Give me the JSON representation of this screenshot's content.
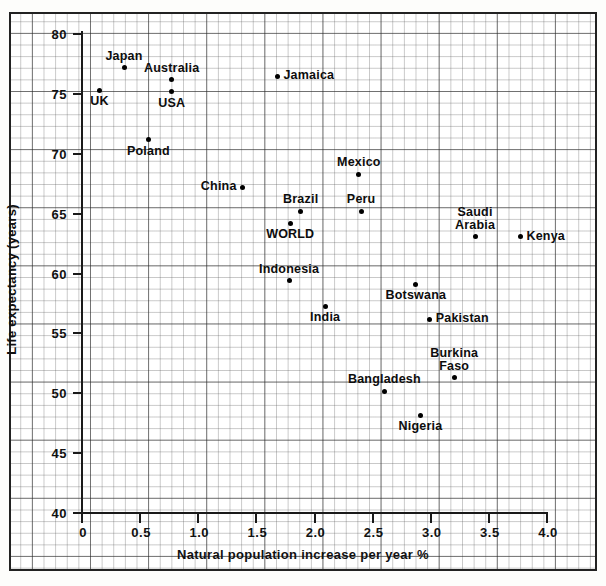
{
  "chart_data": {
    "type": "scatter",
    "title": "",
    "xlabel": "Natural population increase per year %",
    "ylabel": "Life expectancy (years)",
    "xlim": [
      0,
      4.0
    ],
    "ylim": [
      40,
      80
    ],
    "xticks": [
      "0",
      "0.5",
      "1.0",
      "1.5",
      "2.0",
      "2.5",
      "3.0",
      "3.5",
      "4.0"
    ],
    "xtick_values": [
      0,
      0.5,
      1.0,
      1.5,
      2.0,
      2.5,
      3.0,
      3.5,
      4.0
    ],
    "yticks": [
      "40",
      "45",
      "50",
      "55",
      "60",
      "65",
      "70",
      "75",
      "80"
    ],
    "ytick_values": [
      40,
      45,
      50,
      55,
      60,
      65,
      70,
      75,
      80
    ],
    "grid": "graph-paper",
    "legend": "none",
    "points": [
      {
        "name": "Japan",
        "x": 0.37,
        "y": 77.1,
        "label_pos": "above"
      },
      {
        "name": "UK",
        "x": 0.16,
        "y": 75.2,
        "label_pos": "below"
      },
      {
        "name": "Australia",
        "x": 0.78,
        "y": 76.1,
        "label_pos": "above"
      },
      {
        "name": "USA",
        "x": 0.78,
        "y": 75.1,
        "label_pos": "below"
      },
      {
        "name": "Jamaica",
        "x": 1.69,
        "y": 76.4,
        "label_pos": "right"
      },
      {
        "name": "Poland",
        "x": 0.58,
        "y": 71.1,
        "label_pos": "below"
      },
      {
        "name": "Mexico",
        "x": 2.39,
        "y": 68.2,
        "label_pos": "above"
      },
      {
        "name": "China",
        "x": 1.39,
        "y": 67.1,
        "label_pos": "left"
      },
      {
        "name": "Brazil",
        "x": 1.89,
        "y": 65.1,
        "label_pos": "above"
      },
      {
        "name": "Peru",
        "x": 2.41,
        "y": 65.1,
        "label_pos": "above"
      },
      {
        "name": "Saudi Arabia",
        "x": 3.39,
        "y": 63.0,
        "label_pos": "above"
      },
      {
        "name": "Kenya",
        "x": 3.78,
        "y": 63.0,
        "label_pos": "right"
      },
      {
        "name": "WORLD",
        "x": 1.8,
        "y": 64.1,
        "label_pos": "below"
      },
      {
        "name": "Indonesia",
        "x": 1.79,
        "y": 59.3,
        "label_pos": "above"
      },
      {
        "name": "Botswana",
        "x": 2.88,
        "y": 59.0,
        "label_pos": "below"
      },
      {
        "name": "India",
        "x": 2.1,
        "y": 57.2,
        "label_pos": "below"
      },
      {
        "name": "Pakistan",
        "x": 3.0,
        "y": 56.1,
        "label_pos": "right"
      },
      {
        "name": "Burkina Faso",
        "x": 3.21,
        "y": 51.2,
        "label_pos": "above"
      },
      {
        "name": "Bangladesh",
        "x": 2.61,
        "y": 50.1,
        "label_pos": "above"
      },
      {
        "name": "Nigeria",
        "x": 2.92,
        "y": 48.1,
        "label_pos": "below"
      }
    ]
  }
}
